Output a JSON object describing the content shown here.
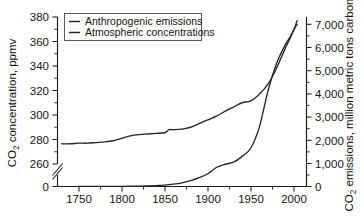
{
  "chart_data": {
    "type": "line",
    "title": "",
    "subtitle": "",
    "xlabel": "",
    "ylabel": "CO2 concentration, ppmv",
    "ylabel_parts": {
      "prefix": "CO",
      "sub": "2",
      "suffix": " concentration, ppmv"
    },
    "y2label": "CO2 emissions, million metric tons carbon",
    "y2label_parts": {
      "prefix": "CO",
      "sub": "2",
      "suffix": " emissions, million metric tons carbon"
    },
    "grid": false,
    "legend_position": "top-left",
    "xlim": [
      1725,
      2015
    ],
    "x_ticks": [
      1750,
      1800,
      1850,
      1900,
      1950,
      2000
    ],
    "x_tick_labels": [
      "1750",
      "1800",
      "1850",
      "1900",
      "1950",
      "2000"
    ],
    "x_minor_interval": 25,
    "ylim": [
      255,
      382
    ],
    "y_ticks": [
      260,
      280,
      300,
      320,
      340,
      360,
      380
    ],
    "y_tick_labels": [
      "260",
      "280",
      "300",
      "320",
      "340",
      "360",
      "380"
    ],
    "y_minor_interval": 10,
    "y_axis_break": true,
    "y_break_label": "0",
    "y2lim": [
      0,
      7200
    ],
    "y2_ticks": [
      0,
      1000,
      2000,
      3000,
      4000,
      5000,
      6000,
      7000
    ],
    "y2_tick_labels": [
      "0",
      "1,000",
      "2,000",
      "3,000",
      "4,000",
      "5,000",
      "6,000",
      "7,000"
    ],
    "y2_minor_interval": 500,
    "series": [
      {
        "name": "Anthropogenic emissions",
        "axis": "right",
        "units": "million metric tons carbon",
        "x": [
          1750,
          1760,
          1770,
          1780,
          1790,
          1800,
          1810,
          1820,
          1830,
          1840,
          1850,
          1860,
          1870,
          1880,
          1890,
          1900,
          1910,
          1920,
          1930,
          1940,
          1950,
          1960,
          1970,
          1980,
          1990,
          1995,
          2000,
          2004
        ],
        "values": [
          3,
          3,
          4,
          5,
          6,
          8,
          11,
          17,
          26,
          40,
          60,
          100,
          160,
          250,
          380,
          550,
          820,
          960,
          1050,
          1300,
          1650,
          2550,
          4100,
          5300,
          6100,
          6400,
          6750,
          7000
        ]
      },
      {
        "name": "Atmospheric concentrations",
        "axis": "left",
        "units": "ppmv",
        "x": [
          1730,
          1740,
          1750,
          1760,
          1770,
          1780,
          1790,
          1800,
          1810,
          1820,
          1830,
          1840,
          1850,
          1855,
          1860,
          1870,
          1880,
          1890,
          1900,
          1910,
          1920,
          1930,
          1940,
          1950,
          1960,
          1970,
          1980,
          1990,
          2000,
          2004
        ],
        "values": [
          276.5,
          276.5,
          277,
          277,
          277.5,
          278,
          279,
          281,
          283,
          284,
          284.5,
          285,
          285.5,
          288,
          288,
          288.5,
          290,
          293,
          296,
          299,
          303,
          306.5,
          310,
          311.5,
          317,
          325,
          338,
          354,
          369,
          377
        ]
      }
    ],
    "legend_entries": [
      {
        "label": "Anthropogenic emissions",
        "color": "#262626"
      },
      {
        "label": "Atmospheric concentrations",
        "color": "#262626"
      }
    ],
    "colors": {
      "line": "#262626",
      "axis": "#1a1a1a",
      "background": "#ffffff"
    }
  }
}
